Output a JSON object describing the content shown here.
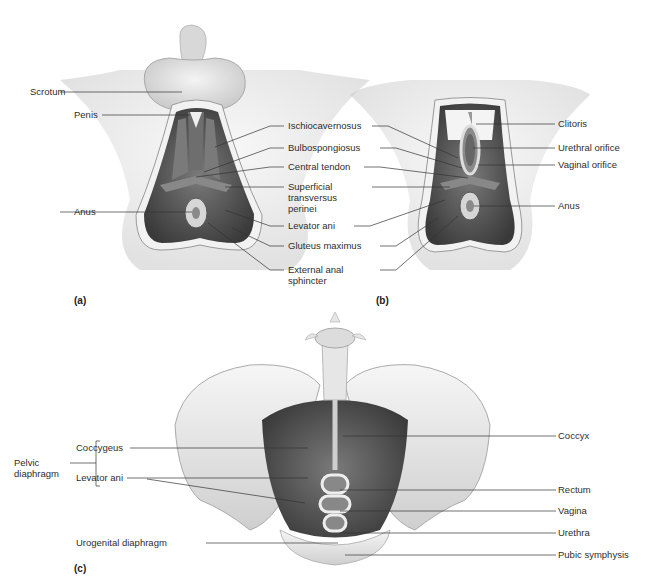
{
  "figure": {
    "panels": [
      {
        "id": "a",
        "tag": "(a)",
        "subject": "male perineum"
      },
      {
        "id": "b",
        "tag": "(b)",
        "subject": "female perineum"
      },
      {
        "id": "c",
        "tag": "(c)",
        "subject": "pelvic floor, superior view"
      }
    ]
  },
  "panel_a": {
    "tag": "(a)",
    "left_labels": {
      "scrotum": "Scrotum",
      "penis": "Penis",
      "anus": "Anus"
    }
  },
  "shared_middle_labels": {
    "ischiocavernosus": "Ischiocavernosus",
    "bulbospongiosus": "Bulbospongiosus",
    "central_tendon": "Central tendon",
    "superficial_transversus_perinei": "Superficial\ntransversus\nperinei",
    "levator_ani": "Levator ani",
    "gluteus_maximus": "Gluteus maximus",
    "external_anal_sphincter": "External anal\nsphincter"
  },
  "panel_b": {
    "tag": "(b)",
    "right_labels": {
      "clitoris": "Clitoris",
      "urethral_orifice": "Urethral orifice",
      "vaginal_orifice": "Vaginal orifice",
      "anus": "Anus"
    }
  },
  "panel_c": {
    "tag": "(c)",
    "group_label": "Pelvic\ndiaphragm",
    "left_labels": {
      "coccygeus": "Coccygeus",
      "levator_ani": "Levator ani",
      "urogenital_diaphragm": "Urogenital diaphragm"
    },
    "right_labels": {
      "coccyx": "Coccyx",
      "rectum": "Rectum",
      "vagina": "Vagina",
      "urethra": "Urethra",
      "pubic_symphysis": "Pubic symphysis"
    }
  },
  "colors": {
    "skin": "#e4e4e4",
    "muscle": "#5a5a5a",
    "muscle_dark": "#3e3e3e",
    "bone": "#ececec",
    "leader_line": "#333333"
  }
}
